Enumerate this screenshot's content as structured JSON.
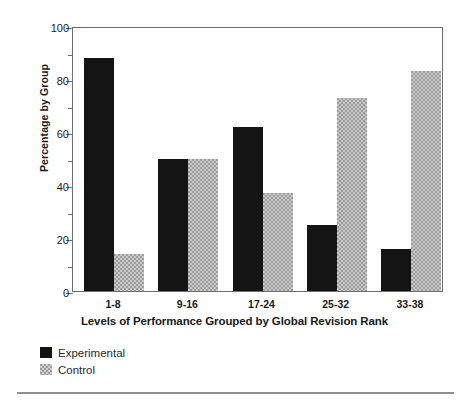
{
  "chart_data": {
    "type": "bar",
    "title": "",
    "xlabel": "Levels of Performance Grouped by Global Revision Rank",
    "ylabel": "Percentage by Group",
    "categories": [
      "1-8",
      "9-16",
      "17-24",
      "25-32",
      "33-38"
    ],
    "series": [
      {
        "name": "Experimental",
        "color": "#141414",
        "values": [
          88,
          50,
          62,
          25,
          16
        ]
      },
      {
        "name": "Control",
        "color": "#9c9c9c",
        "values": [
          14,
          50,
          37,
          73,
          83
        ]
      }
    ],
    "ylim": [
      0,
      100
    ],
    "ytick_labels": [
      "0",
      "20",
      "40",
      "60",
      "80",
      "100"
    ],
    "ytick_values": [
      0,
      20,
      40,
      60,
      80,
      100
    ],
    "yminor_values": [
      10,
      30,
      50,
      70,
      90
    ],
    "grid": false,
    "legend_position": "below-left"
  },
  "legend": {
    "items": [
      {
        "label": "Experimental",
        "swatch": "solid-black-swatch"
      },
      {
        "label": "Control",
        "swatch": "dotted-gray-swatch"
      }
    ]
  }
}
